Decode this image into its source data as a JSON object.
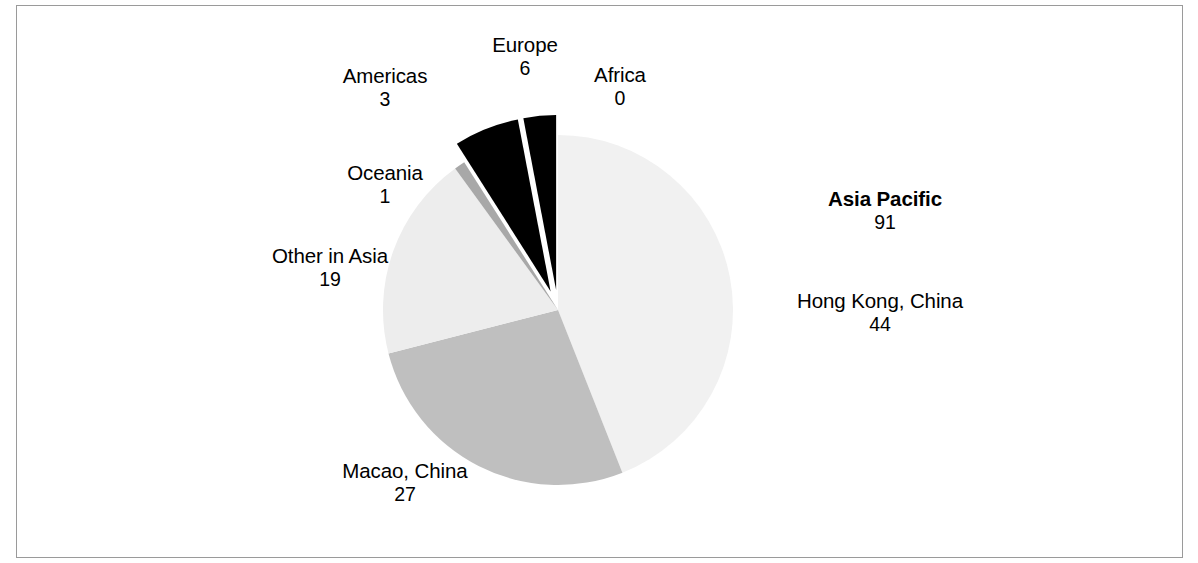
{
  "chart_data": {
    "type": "pie",
    "title": "",
    "subtitle": "",
    "xlabel": "",
    "ylabel": "",
    "legend_position": "none",
    "grid": false,
    "label_format": "name above value",
    "total": 101,
    "categories": [
      "Hong Kong, China",
      "Macao, China",
      "Other in Asia",
      "Oceania",
      "Europe",
      "Americas",
      "Africa"
    ],
    "values": [
      44,
      27,
      19,
      1,
      6,
      3,
      0
    ],
    "colors": [
      "#f1f1f1",
      "#bfbfbf",
      "#ededed",
      "#a8a8a8",
      "#000000",
      "#000000",
      "#000000"
    ],
    "exploded": [
      false,
      false,
      false,
      false,
      true,
      true,
      false
    ],
    "group_annotations": [
      {
        "label": "Asia Pacific",
        "value": 91,
        "bold": true,
        "members": [
          "Hong Kong, China",
          "Macao, China",
          "Other in Asia",
          "Oceania"
        ]
      }
    ],
    "slices": [
      {
        "name": "Hong Kong, China",
        "value": 44,
        "label_bold": false,
        "color": "#f1f1f1",
        "start_angle": 0,
        "end_angle": 156.8,
        "exploded": false
      },
      {
        "name": "Macao, China",
        "value": 27,
        "label_bold": false,
        "color": "#bfbfbf",
        "start_angle": 156.8,
        "end_angle": 253.1,
        "exploded": false
      },
      {
        "name": "Other in Asia",
        "value": 19,
        "label_bold": false,
        "color": "#ededed",
        "start_angle": 253.1,
        "end_angle": 320.8,
        "exploded": false
      },
      {
        "name": "Oceania",
        "value": 1,
        "label_bold": false,
        "color": "#a8a8a8",
        "start_angle": 320.8,
        "end_angle": 324.4,
        "exploded": false
      },
      {
        "name": "Americas",
        "value": 3,
        "label_bold": false,
        "color": "#000000",
        "start_angle": 324.4,
        "end_angle": 335.1,
        "exploded": true
      },
      {
        "name": "Europe",
        "value": 6,
        "label_bold": false,
        "color": "#000000",
        "start_angle": 335.1,
        "end_angle": 356.5,
        "exploded": true
      },
      {
        "name": "Africa",
        "value": 0,
        "label_bold": false,
        "color": "#000000",
        "start_angle": 356.5,
        "end_angle": 356.5,
        "exploded": false
      }
    ]
  },
  "labels": {
    "americas": {
      "name": "Americas",
      "value": "3"
    },
    "europe": {
      "name": "Europe",
      "value": "6"
    },
    "africa": {
      "name": "Africa",
      "value": "0"
    },
    "oceania": {
      "name": "Oceania",
      "value": "1"
    },
    "other_asia": {
      "name": "Other in Asia",
      "value": "19"
    },
    "asia_pacific": {
      "name": "Asia Pacific",
      "value": "91"
    },
    "hong_kong": {
      "name": "Hong Kong, China",
      "value": "44"
    },
    "macao": {
      "name": "Macao, China",
      "value": "27"
    }
  }
}
